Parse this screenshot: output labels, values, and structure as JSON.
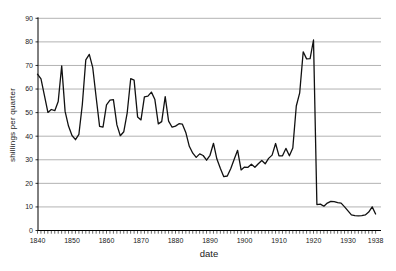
{
  "chart_data": {
    "type": "line",
    "xlabel": "date",
    "ylabel": "shillings per quarter",
    "xlim": [
      1840,
      1938
    ],
    "ylim": [
      0,
      90
    ],
    "xticks": [
      1840,
      1850,
      1860,
      1870,
      1880,
      1890,
      1900,
      1910,
      1920,
      1930,
      1938
    ],
    "yticks": [
      0,
      10,
      20,
      30,
      40,
      50,
      60,
      70,
      80,
      90
    ],
    "grid": "horizontal",
    "legend": "none",
    "colors": {
      "series": "#111111",
      "grid": "#b3b3b3",
      "axis": "#000000",
      "text": "#1a1a1a",
      "background": "#ffffff"
    },
    "x": [
      1840,
      1841,
      1842,
      1843,
      1844,
      1845,
      1846,
      1847,
      1848,
      1849,
      1850,
      1851,
      1852,
      1853,
      1854,
      1855,
      1856,
      1857,
      1858,
      1859,
      1860,
      1861,
      1862,
      1863,
      1864,
      1865,
      1866,
      1867,
      1868,
      1869,
      1870,
      1871,
      1872,
      1873,
      1874,
      1875,
      1876,
      1877,
      1878,
      1879,
      1880,
      1881,
      1882,
      1883,
      1884,
      1885,
      1886,
      1887,
      1888,
      1889,
      1890,
      1891,
      1892,
      1893,
      1894,
      1895,
      1896,
      1897,
      1898,
      1899,
      1900,
      1901,
      1902,
      1903,
      1904,
      1905,
      1906,
      1907,
      1908,
      1909,
      1910,
      1911,
      1912,
      1913,
      1914,
      1915,
      1916,
      1917,
      1918,
      1919,
      1920,
      1921,
      1922,
      1923,
      1924,
      1925,
      1926,
      1927,
      1928,
      1929,
      1930,
      1931,
      1932,
      1933,
      1934,
      1935,
      1936,
      1937,
      1938
    ],
    "values": [
      66.3,
      64.3,
      57.3,
      50.1,
      51.3,
      50.8,
      54.7,
      69.8,
      50.5,
      44.3,
      40.3,
      38.5,
      40.8,
      53.3,
      72.4,
      74.7,
      69.2,
      56.3,
      44.2,
      43.8,
      53.3,
      55.3,
      55.5,
      44.8,
      40.2,
      41.9,
      49.9,
      64.4,
      63.8,
      48.2,
      46.9,
      56.7,
      57.0,
      58.7,
      55.7,
      45.2,
      46.2,
      56.8,
      46.4,
      43.8,
      44.3,
      45.3,
      45.1,
      41.6,
      35.7,
      32.8,
      31.0,
      32.5,
      31.8,
      29.8,
      31.9,
      37.0,
      30.3,
      26.3,
      22.8,
      23.1,
      26.2,
      30.2,
      34.0,
      25.7,
      26.9,
      26.8,
      28.1,
      26.8,
      28.3,
      29.7,
      28.3,
      30.6,
      32.0,
      36.9,
      31.7,
      31.7,
      34.8,
      31.7,
      35.0,
      52.8,
      58.4,
      75.8,
      72.8,
      72.9,
      80.8,
      11.0,
      11.2,
      10.3,
      11.6,
      12.4,
      12.2,
      11.8,
      11.6,
      10.0,
      8.3,
      6.6,
      6.3,
      6.2,
      6.3,
      6.6,
      7.8,
      10.0,
      7.0
    ]
  }
}
